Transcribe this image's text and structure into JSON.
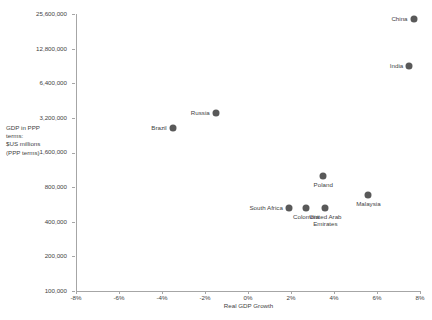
{
  "chart_data": {
    "type": "scatter",
    "title": "",
    "xlabel": "Real GDP Growth",
    "ylabel": "GDP in PPP terms:\n$US millions\n(PPP terms)",
    "ylabel_lines": [
      "GDP in PPP",
      "terms:",
      "$US millions",
      "(PPP terms)"
    ],
    "xlim": [
      -8,
      8
    ],
    "ylim": [
      100000,
      25600000
    ],
    "yscale": "log2",
    "xscale": "linear",
    "grid": false,
    "legend": "none",
    "marker_color": "#595959",
    "axis_color": "#a6a6a6",
    "text_color": "#3f3f3f",
    "xticks": [
      "-8%",
      "-6%",
      "-4%",
      "-2%",
      "0%",
      "2%",
      "4%",
      "6%",
      "8%"
    ],
    "xtick_values": [
      -8,
      -6,
      -4,
      -2,
      0,
      2,
      4,
      6,
      8
    ],
    "yticks": [
      "100,000",
      "200,000",
      "400,000",
      "800,000",
      "1,600,000",
      "3,200,000",
      "6,400,000",
      "12,800,000",
      "25,600,000"
    ],
    "ytick_values": [
      100000,
      200000,
      400000,
      800000,
      1600000,
      3200000,
      6400000,
      12800000,
      25600000
    ],
    "points": [
      {
        "label": "China",
        "x": 7.7,
        "y": 23000000,
        "label_pos": "left"
      },
      {
        "label": "India",
        "x": 7.5,
        "y": 9000000,
        "label_pos": "left"
      },
      {
        "label": "Russia",
        "x": -1.5,
        "y": 3500000,
        "label_pos": "left"
      },
      {
        "label": "Brazil",
        "x": -3.5,
        "y": 2600000,
        "label_pos": "left"
      },
      {
        "label": "Poland",
        "x": 3.5,
        "y": 1000000,
        "label_pos": "below"
      },
      {
        "label": "Malaysia",
        "x": 5.6,
        "y": 680000,
        "label_pos": "below"
      },
      {
        "label": "South Africa",
        "x": 1.9,
        "y": 530000,
        "label_pos": "left"
      },
      {
        "label": "Colombia",
        "x": 2.7,
        "y": 530000,
        "label_pos": "below"
      },
      {
        "label": "United Arab\nEmirates",
        "x": 3.6,
        "y": 530000,
        "label_pos": "below"
      }
    ]
  }
}
